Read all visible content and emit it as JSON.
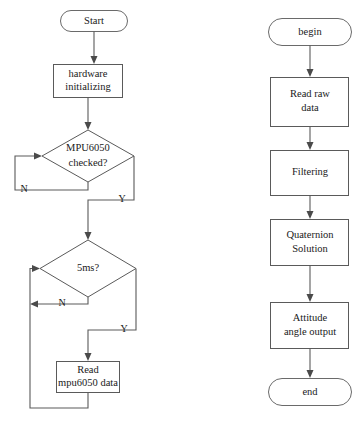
{
  "diagram": {
    "type": "flowchart",
    "background_color": "#ffffff",
    "line_color": "#5a5a5a",
    "text_color": "#1a1a1a",
    "left_flow": {
      "name": "main-initialization-flow",
      "nodes": [
        {
          "id": "start",
          "shape": "terminator",
          "text": "Start"
        },
        {
          "id": "hardware",
          "shape": "process",
          "line1": "hardware",
          "line2": "initializing"
        },
        {
          "id": "mpu_check",
          "shape": "decision",
          "line1": "MPU6050",
          "line2": "checked?"
        },
        {
          "id": "timer_check",
          "shape": "decision",
          "line1": "5ms?"
        },
        {
          "id": "read_mpu",
          "shape": "process",
          "line1": "Read",
          "line2": "mpu6050 data"
        }
      ],
      "branch_labels": {
        "mpu_no": "N",
        "mpu_yes": "Y",
        "timer_no": "N",
        "timer_yes": "Y"
      }
    },
    "right_flow": {
      "name": "attitude-solution-flow",
      "nodes": [
        {
          "id": "begin",
          "shape": "terminator",
          "text": "begin"
        },
        {
          "id": "read_raw",
          "shape": "process",
          "line1": "Read raw",
          "line2": "data"
        },
        {
          "id": "filtering",
          "shape": "process",
          "line1": "Filtering"
        },
        {
          "id": "quaternion",
          "shape": "process",
          "line1": "Quaternion",
          "line2": "Solution"
        },
        {
          "id": "attitude",
          "shape": "process",
          "line1": "Attitude",
          "line2": "angle output"
        },
        {
          "id": "end",
          "shape": "terminator",
          "text": "end"
        }
      ]
    }
  }
}
